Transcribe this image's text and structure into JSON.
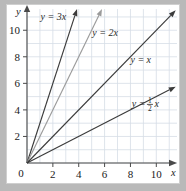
{
  "chart_data": {
    "type": "line",
    "title": "",
    "xlabel": "x",
    "ylabel": "y",
    "xlim": [
      0,
      11.6
    ],
    "ylim": [
      0,
      11.6
    ],
    "xticks": [
      0,
      2,
      4,
      6,
      8,
      10
    ],
    "yticks": [
      0,
      2,
      4,
      6,
      8,
      10
    ],
    "xtick_labels": [
      "0",
      "2",
      "4",
      "6",
      "8",
      "10"
    ],
    "ytick_labels": [
      "0",
      "2",
      "4",
      "6",
      "8",
      "10"
    ],
    "grid": true,
    "grid_step": 1,
    "legend": "inline-labels",
    "origin_label": "0",
    "series": [
      {
        "name": "y = 3x",
        "label": "y = 3x",
        "slope": 3,
        "intercept": 0,
        "color": "#3b3b3b",
        "x_start": 0,
        "y_start": 0,
        "x_end": 3.87,
        "y_end": 11.6,
        "label_x": 1.05,
        "label_y": 10.75
      },
      {
        "name": "y = 2x",
        "label": "y = 2x",
        "slope": 2,
        "intercept": 0,
        "color": "#9b9b9b",
        "x_start": 0,
        "y_start": 0,
        "x_end": 5.8,
        "y_end": 11.6,
        "label_x": 5.05,
        "label_y": 9.55
      },
      {
        "name": "y = x",
        "label": "y = x",
        "slope": 1,
        "intercept": 0,
        "color": "#3b3b3b",
        "x_start": 0,
        "y_start": 0,
        "x_end": 11.5,
        "y_end": 11.5,
        "label_x": 8.0,
        "label_y": 7.55
      },
      {
        "name": "y = 1/2 x",
        "label": "y =",
        "numerator": "1",
        "denominator": "2",
        "variable": "x",
        "slope": 0.5,
        "intercept": 0,
        "color": "#3b3b3b",
        "x_start": 0,
        "y_start": 0,
        "x_end": 11.5,
        "y_end": 5.75,
        "label_x": 8.1,
        "label_y": 4.25
      }
    ]
  },
  "axes": {
    "x_axis_name": "x",
    "y_axis_name": "y"
  }
}
